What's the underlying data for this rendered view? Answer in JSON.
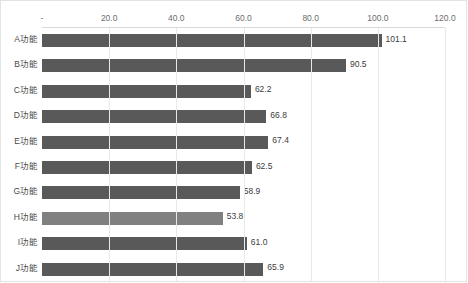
{
  "chart_data": {
    "type": "bar",
    "orientation": "horizontal",
    "title": "各功能平均使用时长对比",
    "categories": [
      "A功能",
      "B功能",
      "C功能",
      "D功能",
      "E功能",
      "F功能",
      "G功能",
      "H功能",
      "I功能",
      "J功能"
    ],
    "values": [
      101.1,
      90.5,
      62.2,
      66.8,
      67.4,
      62.5,
      58.9,
      53.8,
      61.0,
      65.9
    ],
    "value_labels": [
      "101.1",
      "90.5",
      "62.2",
      "66.8",
      "67.4",
      "62.5",
      "58.9",
      "53.8",
      "61.0",
      "65.9"
    ],
    "xlabel": "",
    "ylabel": "",
    "xlim": [
      0,
      120
    ],
    "xticks": [
      0,
      20,
      40,
      60,
      80,
      100,
      120
    ],
    "xtick_labels": [
      "-",
      "20.0",
      "40.0",
      "60.0",
      "80.0",
      "100.0",
      "120.0"
    ],
    "grid": true,
    "grid_axis": "x",
    "legend": false,
    "legend_position": "none",
    "axis_position": "top",
    "bar_color": "#595959",
    "highlight_color": "#808080",
    "highlight_index": 7,
    "grid_color": "#e8e8e8",
    "axis_color": "#d9d9d9",
    "background": "#ffffff",
    "data_labels_shown": true
  },
  "frame": {
    "border_color": "#e3e3e3"
  }
}
